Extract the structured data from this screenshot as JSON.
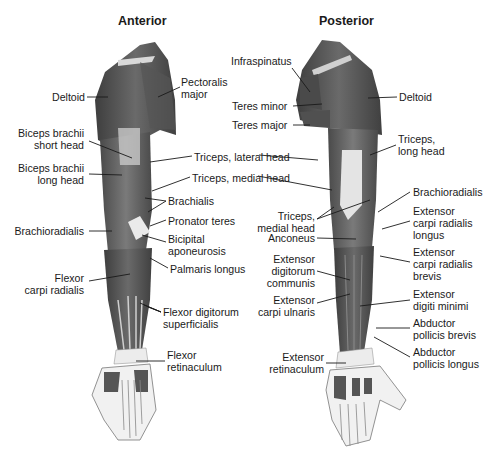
{
  "figure": {
    "views": [
      {
        "id": "anterior",
        "title": "Anterior"
      },
      {
        "id": "posterior",
        "title": "Posterior"
      }
    ],
    "anterior_labels": [
      {
        "text": "Deltoid",
        "x": 47,
        "y": 91,
        "align": "r",
        "w": 38
      },
      {
        "text": "Pectoralis\nmajor",
        "x": 181,
        "y": 76,
        "align": "l",
        "w": 60
      },
      {
        "text": "Biceps brachii\nshort head",
        "x": 6,
        "y": 127,
        "align": "r",
        "w": 78
      },
      {
        "text": "Triceps, lateral head",
        "x": 194,
        "y": 151,
        "align": "l",
        "w": 120
      },
      {
        "text": "Biceps brachii\nlong head",
        "x": 6,
        "y": 162,
        "align": "r",
        "w": 78
      },
      {
        "text": "Triceps, medial head",
        "x": 192,
        "y": 172,
        "align": "l",
        "w": 120
      },
      {
        "text": "Brachialis",
        "x": 168,
        "y": 195,
        "align": "l",
        "w": 60
      },
      {
        "text": "Pronator teres",
        "x": 168,
        "y": 215,
        "align": "l",
        "w": 80
      },
      {
        "text": "Brachioradialis",
        "x": 6,
        "y": 225,
        "align": "r",
        "w": 78
      },
      {
        "text": "Bicipital\naponeurosis",
        "x": 168,
        "y": 233,
        "align": "l",
        "w": 70
      },
      {
        "text": "Palmaris longus",
        "x": 170,
        "y": 263,
        "align": "l",
        "w": 90
      },
      {
        "text": "Flexor\ncarpi radialis",
        "x": 6,
        "y": 272,
        "align": "r",
        "w": 78
      },
      {
        "text": "Flexor digitorum\nsuperficialis",
        "x": 163,
        "y": 306,
        "align": "l",
        "w": 100
      },
      {
        "text": "Flexor\nretinaculum",
        "x": 167,
        "y": 349,
        "align": "l",
        "w": 70
      }
    ],
    "posterior_labels": [
      {
        "text": "Infraspinatus",
        "x": 231,
        "y": 55,
        "align": "l",
        "w": 70
      },
      {
        "text": "Teres minor",
        "x": 232,
        "y": 100,
        "align": "l",
        "w": 64
      },
      {
        "text": "Deltoid",
        "x": 399,
        "y": 91,
        "align": "l",
        "w": 40
      },
      {
        "text": "Teres major",
        "x": 232,
        "y": 119,
        "align": "l",
        "w": 64
      },
      {
        "text": "Triceps,\nlong head",
        "x": 398,
        "y": 133,
        "align": "l",
        "w": 60
      },
      {
        "text": "Triceps,\nmedial head",
        "x": 253,
        "y": 210,
        "align": "r",
        "w": 62
      },
      {
        "text": "Brachioradialis",
        "x": 413,
        "y": 186,
        "align": "l",
        "w": 82
      },
      {
        "text": "Extensor\ncarpi radialis\nlongus",
        "x": 413,
        "y": 205,
        "align": "l",
        "w": 80
      },
      {
        "text": "Anconeus",
        "x": 253,
        "y": 232,
        "align": "r",
        "w": 62
      },
      {
        "text": "Extensor\ndigitorum\ncommunis",
        "x": 253,
        "y": 253,
        "align": "r",
        "w": 62
      },
      {
        "text": "Extensor\ncarpi radialis\nbrevis",
        "x": 413,
        "y": 246,
        "align": "l",
        "w": 80
      },
      {
        "text": "Extensor\ncarpi ulnaris",
        "x": 250,
        "y": 294,
        "align": "r",
        "w": 65
      },
      {
        "text": "Extensor\ndigiti minimi",
        "x": 413,
        "y": 288,
        "align": "l",
        "w": 80
      },
      {
        "text": "Abductor\npollicis brevis",
        "x": 413,
        "y": 317,
        "align": "l",
        "w": 80
      },
      {
        "text": "Extensor\nretinaculum",
        "x": 266,
        "y": 351,
        "align": "r",
        "w": 58
      },
      {
        "text": "Abductor\npollicis longus",
        "x": 413,
        "y": 346,
        "align": "l",
        "w": 85
      }
    ]
  },
  "colors": {
    "muscle": "#5a5a5a",
    "muscle_dark": "#3c3c3c",
    "tendon": "#e6e6e6",
    "bone": "#f0f0f0",
    "line": "#1a1a1a",
    "text": "#1a1a1a"
  }
}
